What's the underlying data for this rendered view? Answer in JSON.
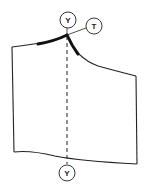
{
  "diagram": {
    "colors": {
      "line": "#222222",
      "background": "#ffffff"
    },
    "labels": {
      "top_marker": "Y",
      "tangent_marker": "T",
      "bottom_marker": "Y"
    },
    "elements": {
      "outline": "pattern-piece-outline",
      "center_line": "dashed",
      "emphasized_segments": [
        "shoulder-seam-near-neck",
        "armhole-start"
      ]
    }
  }
}
